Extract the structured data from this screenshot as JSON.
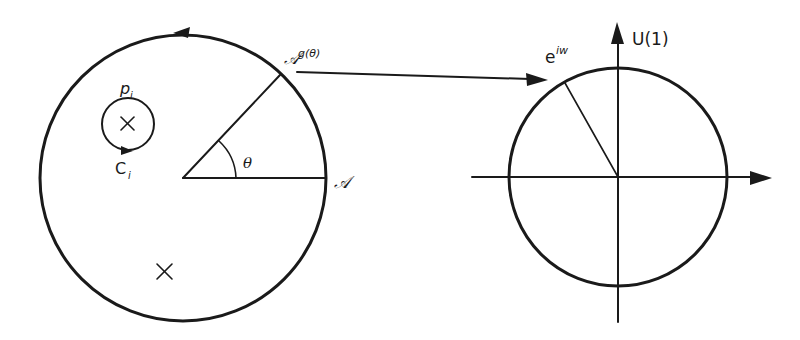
{
  "figure": {
    "stroke_color": "#1a1a1a",
    "background_color": "#ffffff"
  },
  "left_diagram": {
    "labels": {
      "point_A": "𝒜",
      "gauge_transformed_base": "𝒜",
      "gauge_transformed_superscript": "g(θ)",
      "angle": "θ",
      "puncture_label_base": "p",
      "puncture_label_sub": "i",
      "contour_label_base": "C",
      "contour_label_sub": "i"
    },
    "markers": [
      "puncture-cross",
      "singularity-cross"
    ],
    "orientation": "counterclockwise"
  },
  "right_diagram": {
    "labels": {
      "axis_title": "U(1)",
      "phase_base": "e",
      "phase_superscript": "iw"
    }
  },
  "map_arrow": {
    "from": "𝒜g(θ)",
    "to": "e^{iw}"
  }
}
